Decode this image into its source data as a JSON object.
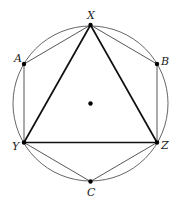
{
  "diagram": {
    "colors": {
      "background": "#ffffff",
      "circle": "#555555",
      "hexagon": "#444444",
      "triangle": "#111111",
      "points": "#000000"
    },
    "circle": {
      "cx": 90.5,
      "cy": 103.5,
      "r": 77.5
    },
    "center_point": {
      "x": 90.5,
      "y": 103.5,
      "label": ""
    },
    "points": {
      "X": {
        "x": 90.5,
        "y": 25,
        "label": "X",
        "lx": 87,
        "ly": 19
      },
      "A": {
        "x": 24,
        "y": 64,
        "label": "A",
        "lx": 14,
        "ly": 62
      },
      "B": {
        "x": 157,
        "y": 64,
        "label": "B",
        "lx": 161,
        "ly": 65
      },
      "Y": {
        "x": 24,
        "y": 142.5,
        "label": "Y",
        "lx": 12,
        "ly": 150
      },
      "Z": {
        "x": 157,
        "y": 142.5,
        "label": "Z",
        "lx": 161,
        "ly": 149
      },
      "C": {
        "x": 90.5,
        "y": 181.5,
        "label": "C",
        "lx": 87,
        "ly": 196
      }
    },
    "hexagon_order": [
      "X",
      "B",
      "Z",
      "C",
      "Y",
      "A"
    ],
    "triangle_order": [
      "X",
      "Y",
      "Z"
    ]
  }
}
